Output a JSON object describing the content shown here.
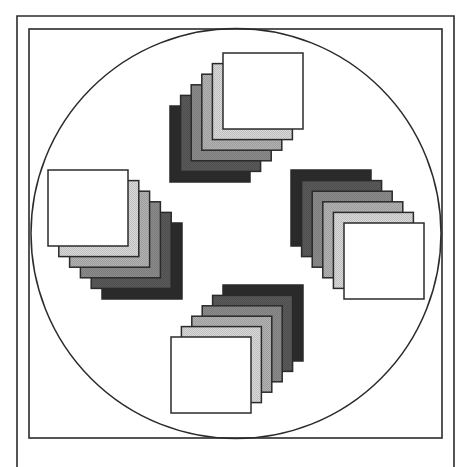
{
  "figure": {
    "width": 468,
    "height": 467,
    "background": "#ffffff",
    "stroke_color": "#2b2b2b",
    "outer_frame": {
      "x": 17,
      "y": 16,
      "right": 454,
      "bottom_open": true
    },
    "inner_frame": {
      "x": 29,
      "y": 29,
      "width": 413,
      "height": 409
    },
    "circle": {
      "cx": 236,
      "cy": 233.5,
      "r": 205
    },
    "square_size": {
      "w": 80,
      "h": 76
    },
    "shades": [
      "#2a2a2a",
      "#5a5a5a",
      "#8c8c8c",
      "#b3b3b3",
      "#d9d9d9",
      "#ffffff"
    ],
    "shade_names": [
      "black",
      "dark-gray",
      "mid-gray",
      "light-gray",
      "pale-gray",
      "white"
    ],
    "step": 10.5,
    "clusters": [
      {
        "name": "top-cluster",
        "back_x": 170,
        "back_y": 106,
        "dx": 10.6,
        "dy": -10.6
      },
      {
        "name": "right-cluster",
        "back_x": 291,
        "back_y": 170,
        "dx": 10.6,
        "dy": 10.6
      },
      {
        "name": "bottom-cluster",
        "back_x": 223,
        "back_y": 285,
        "dx": -10.4,
        "dy": 10.4
      },
      {
        "name": "left-cluster",
        "back_x": 102,
        "back_y": 223,
        "dx": -10.8,
        "dy": -10.6
      }
    ]
  }
}
